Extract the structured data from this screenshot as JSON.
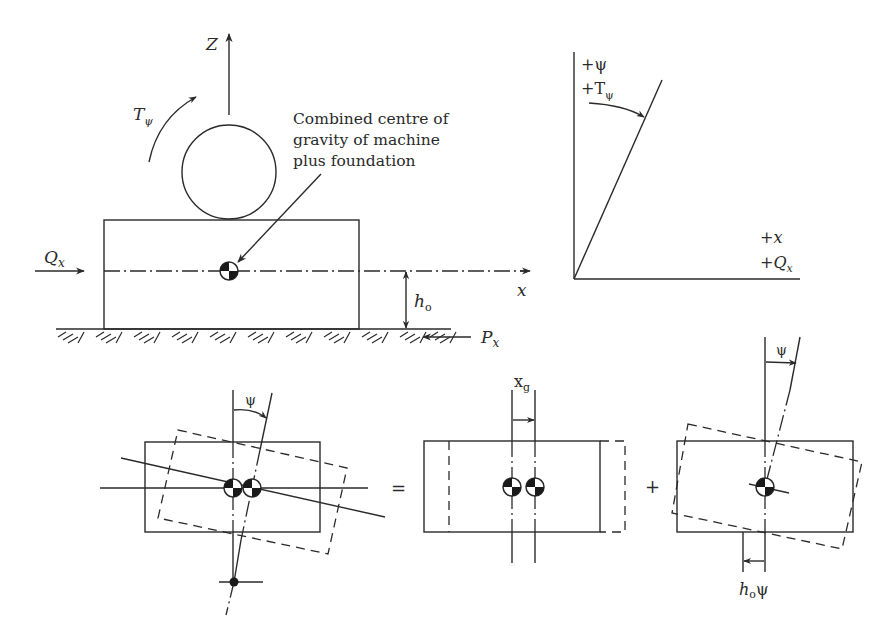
{
  "diagram": {
    "type": "engineering-free-body"
  },
  "top_left": {
    "z_axis_label": "Z",
    "x_axis_label": "x",
    "torque_label_main": "T",
    "torque_label_sub": "ψ",
    "force_qx_main": "Q",
    "force_qx_sub": "x",
    "height_label_main": "h",
    "height_label_sub": "o",
    "force_px_main": "P",
    "force_px_sub": "x",
    "annotation_lines": [
      "Combined centre of",
      "gravity of machine",
      "plus foundation"
    ]
  },
  "top_right": {
    "psi_label": "+ψ",
    "torque_label_prefix": "+T",
    "torque_label_sub": "ψ",
    "x_label": "+x",
    "qx_label_prefix": "+Q",
    "qx_label_sub": "x"
  },
  "bottom": {
    "panel1_angle_label": "ψ",
    "equals_sign": "=",
    "panel2_offset_main": "x",
    "panel2_offset_sub": "g",
    "plus_sign": "+",
    "panel3_angle_label": "ψ",
    "panel3_disp_main": "h",
    "panel3_disp_sub": "o",
    "panel3_disp_suffix": "ψ"
  },
  "colors": {
    "ink": "#2a2a2a",
    "background": "#ffffff"
  }
}
